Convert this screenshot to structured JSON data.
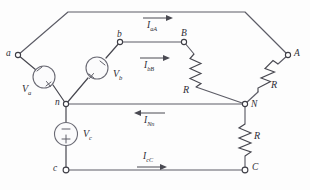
{
  "figure": {
    "type": "circuit-diagram",
    "background_color": "#fdfdfd",
    "wire_color": "#5c5c66"
  },
  "nodes": {
    "a": {
      "label": "a",
      "x": 18,
      "y": 55
    },
    "b": {
      "label": "b",
      "x": 120,
      "y": 42
    },
    "c": {
      "label": "c",
      "x": 66,
      "y": 170
    },
    "n": {
      "label": "n",
      "x": 66,
      "y": 104
    },
    "A": {
      "label": "A",
      "x": 288,
      "y": 55
    },
    "B": {
      "label": "B",
      "x": 184,
      "y": 42
    },
    "C": {
      "label": "C",
      "x": 245,
      "y": 170
    },
    "N": {
      "label": "N",
      "x": 245,
      "y": 104
    }
  },
  "sources": [
    {
      "name": "source-a",
      "label": "V",
      "subscript": "a",
      "plus": "+",
      "minus": "−"
    },
    {
      "name": "source-b",
      "label": "V",
      "subscript": "b",
      "plus": "+",
      "minus": "−"
    },
    {
      "name": "source-c",
      "label": "V",
      "subscript": "c",
      "plus": "+",
      "minus": "−"
    }
  ],
  "resistors": [
    {
      "name": "resistor-bB",
      "label": "R"
    },
    {
      "name": "resistor-aA",
      "label": "R"
    },
    {
      "name": "resistor-cC",
      "label": "R"
    }
  ],
  "currents": [
    {
      "name": "current-aA",
      "label": "I",
      "subscript": "aA",
      "direction": "right"
    },
    {
      "name": "current-bB",
      "label": "I",
      "subscript": "bB",
      "direction": "right"
    },
    {
      "name": "current-Nn",
      "label": "I",
      "subscript": "Nn",
      "direction": "left"
    },
    {
      "name": "current-cC",
      "label": "I",
      "subscript": "cC",
      "direction": "right"
    }
  ]
}
